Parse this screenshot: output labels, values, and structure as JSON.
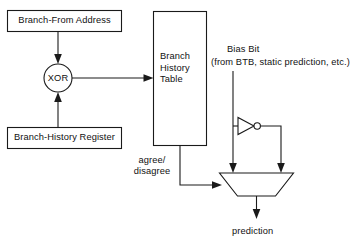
{
  "diagram": {
    "nodes": {
      "branch_from_address": {
        "label": "Branch-From Address",
        "shape": "rectangle"
      },
      "branch_history_register": {
        "label": "Branch-History Register",
        "shape": "rectangle"
      },
      "xor_gate": {
        "label": "XOR",
        "shape": "circle"
      },
      "branch_history_table": {
        "line1": "Branch",
        "line2": "History",
        "line3": "Table",
        "shape": "rectangle"
      },
      "inverter": {
        "label": "",
        "shape": "not-gate"
      },
      "multiplexer": {
        "label": "",
        "shape": "trapezoid"
      }
    },
    "labels": {
      "bias_bit_title": "Bias Bit",
      "bias_bit_source": "(from BTB, static prediction, etc.)",
      "agree_disagree_line1": "agree/",
      "agree_disagree_line2": "disagree",
      "prediction": "prediction"
    },
    "colors": {
      "background": "#ffffff",
      "stroke": "#1a1a1a",
      "text": "#111111"
    }
  }
}
